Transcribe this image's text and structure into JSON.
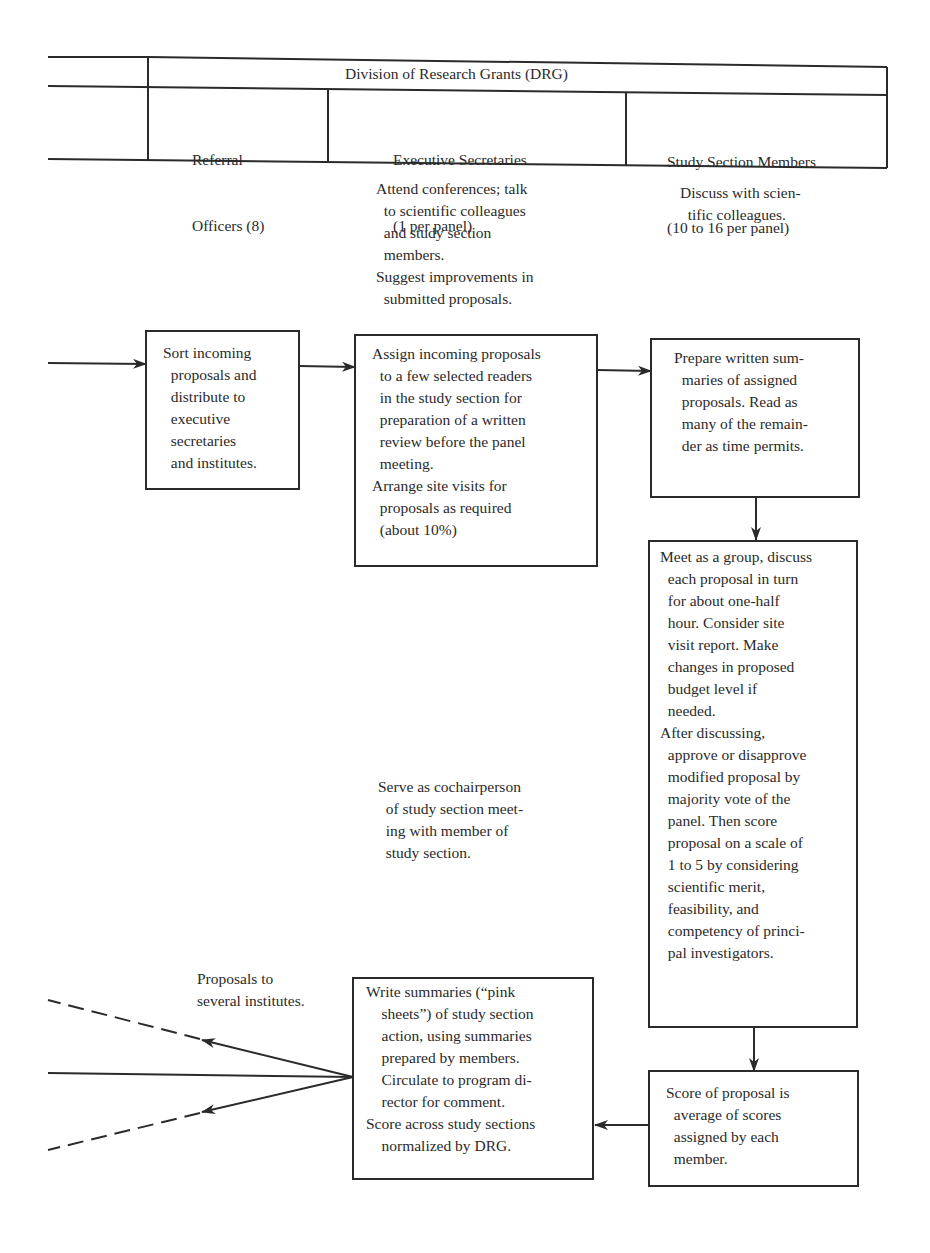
{
  "header": {
    "division": "Division of Research Grants (DRG)",
    "columns": [
      {
        "line1": "Referral",
        "line2": "Officers (8)"
      },
      {
        "line1": "Executive Secretaries",
        "line2": "(1 per panel)"
      },
      {
        "line1": "Study Section Members",
        "line2": "(10 to 16 per panel)"
      }
    ]
  },
  "notes": {
    "exec_sec_top": "Attend conferences; talk\n  to scientific colleagues\n  and study section\n  members.\nSuggest improvements in\n  submitted proposals.",
    "members_top": "Discuss with scien-\n  tific colleagues.",
    "exec_sec_middle": "Serve as cochairperson\n  of study section meet-\n  ing with member of\n  study section.",
    "proposals_to": "Proposals to\nseveral institutes."
  },
  "boxes": {
    "sort": "Sort incoming\n  proposals and\n  distribute to\n  executive\n  secretaries\n  and institutes.",
    "assign": "Assign incoming proposals\n  to a few selected readers\n  in the study section for\n  preparation of a written\n  review before the panel\n  meeting.\nArrange site visits for\n  proposals as required\n  (about 10%)",
    "prepare": "Prepare written sum-\n  maries of assigned\n  proposals. Read as\n  many of the remain-\n  der as time permits.",
    "meet": "Meet as a group, discuss\n  each proposal in turn\n  for about one-half\n  hour. Consider site\n  visit report. Make\n  changes in proposed\n  budget level if\n  needed.\nAfter discussing,\n  approve or disapprove\n  modified proposal by\n  majority vote of the\n  panel. Then score\n  proposal on a scale of\n  1 to 5 by considering\n  scientific merit,\n  feasibility, and\n  competency of princi-\n  pal investigators.",
    "write": "Write summaries (“pink\n    sheets”) of study section\n    action, using summaries\n    prepared by members.\n    Circulate to program di-\n    rector for comment.\nScore across study sections\n    normalized by DRG.",
    "score": "Score of proposal is\n  average of scores\n  assigned by each\n  member."
  },
  "colors": {
    "ink": "#2a2a2a",
    "background": "#ffffff"
  }
}
